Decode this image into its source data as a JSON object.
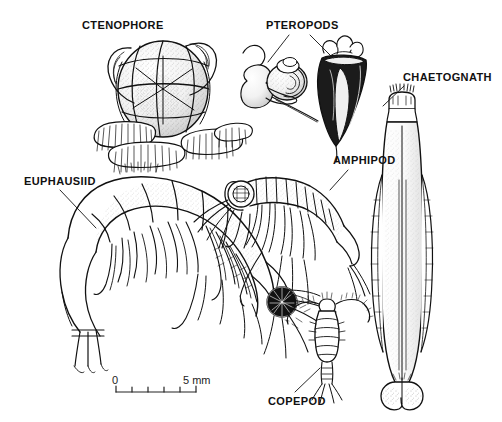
{
  "figure": {
    "kind": "scientific-illustration",
    "background_color": "#ffffff",
    "ink_color": "#111111",
    "width": 502,
    "height": 422
  },
  "labels": [
    {
      "id": "ctenophore",
      "text": "CTENOPHORE",
      "x": 82,
      "y": 19,
      "leader": false
    },
    {
      "id": "pteropods",
      "text": "PTEROPODS",
      "x": 266,
      "y": 19,
      "leader": true
    },
    {
      "id": "chaetognath",
      "text": "CHAETOGNATH",
      "x": 403,
      "y": 71,
      "leader": true
    },
    {
      "id": "amphipod",
      "text": "AMPHIPOD",
      "x": 333,
      "y": 154,
      "leader": true
    },
    {
      "id": "euphausiid",
      "text": "EUPHAUSIID",
      "x": 24,
      "y": 175,
      "leader": true
    },
    {
      "id": "copepod",
      "text": "COPEPOD",
      "x": 268,
      "y": 395,
      "leader": true
    }
  ],
  "scale_bar": {
    "left_value": "0",
    "right_value": "5 mm",
    "units": "mm",
    "min": 0,
    "max": 5,
    "tick_count": 6,
    "bar_left_px": 116,
    "bar_right_px": 196,
    "bar_y_px": 392
  },
  "organisms": [
    {
      "id": "ctenophore",
      "common_name": "Ctenophore",
      "label": "CTENOPHORE"
    },
    {
      "id": "pteropod-a",
      "common_name": "Pteropod",
      "label": "PTEROPODS"
    },
    {
      "id": "pteropod-b",
      "common_name": "Pteropod",
      "label": "PTEROPODS"
    },
    {
      "id": "chaetognath",
      "common_name": "Chaetognath",
      "label": "CHAETOGNATH"
    },
    {
      "id": "amphipod",
      "common_name": "Amphipod",
      "label": "AMPHIPOD"
    },
    {
      "id": "euphausiid",
      "common_name": "Euphausiid",
      "label": "EUPHAUSIID"
    },
    {
      "id": "copepod",
      "common_name": "Copepod",
      "label": "COPEPOD"
    }
  ]
}
